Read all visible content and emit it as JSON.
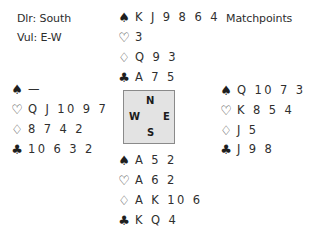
{
  "info": {
    "dealer": "Dlr: South",
    "vulnerability": "Vul: E-W",
    "scoring": "Matchpoints"
  },
  "suit_icons": {
    "spades": "♠",
    "hearts": "♡",
    "diamonds": "♢",
    "clubs": "♣"
  },
  "hands": {
    "north": {
      "spades": "K J 9 8 6 4",
      "hearts": "3",
      "diamonds": "Q 9 3",
      "clubs": "A 7 5"
    },
    "west": {
      "spades": "—",
      "hearts": "Q J 10 9 7",
      "diamonds": "8 7 4 2",
      "clubs": "10 6 3 2"
    },
    "east": {
      "spades": "Q 10 7 3",
      "hearts": "K 8 5 4",
      "diamonds": "J 5",
      "clubs": "J 9 8"
    },
    "south": {
      "spades": "A 5 2",
      "hearts": "A 6 2",
      "diamonds": "A K 10 6",
      "clubs": "K Q 4"
    }
  },
  "compass": {
    "north": "N",
    "west": "W",
    "east": "E",
    "south": "S"
  }
}
